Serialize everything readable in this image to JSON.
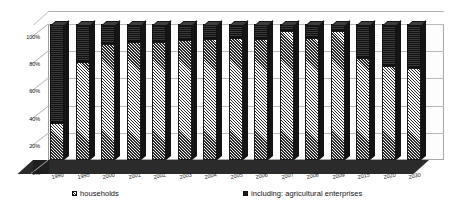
{
  "chart_data": {
    "type": "bar",
    "subtype": "stacked-100-percent-3d",
    "title": "",
    "xlabel": "",
    "ylabel": "",
    "ylim": [
      0,
      100
    ],
    "ytick_labels": [
      "0%",
      "20%",
      "40%",
      "60%",
      "80%",
      "100%"
    ],
    "ytick_values": [
      0,
      20,
      40,
      60,
      80,
      100
    ],
    "grid": true,
    "legend_position": "bottom",
    "categories": [
      "1990",
      "1995",
      "2000",
      "2001",
      "2002",
      "2003",
      "2004",
      "2005",
      "2006",
      "2007",
      "2008",
      "2009",
      "2015",
      "2020",
      "2030"
    ],
    "series": [
      {
        "name": "households",
        "pattern": "diagonal-hatch",
        "color": "#c9c9c9",
        "values": [
          27,
          72,
          85,
          87,
          87,
          88,
          89,
          90,
          89,
          95,
          90,
          95,
          75,
          69,
          68
        ]
      },
      {
        "name": "including: agricultural enterprises",
        "pattern": "solid-dark",
        "color": "#1d1d1d",
        "values": [
          73,
          28,
          15,
          13,
          13,
          12,
          11,
          10,
          11,
          5,
          10,
          5,
          25,
          31,
          32
        ]
      }
    ]
  },
  "legend": {
    "items": [
      {
        "label": "households",
        "marker": "hatched-square-swatch"
      },
      {
        "label": "including: agricultural enterprises",
        "marker": "dark-square-swatch"
      }
    ]
  }
}
